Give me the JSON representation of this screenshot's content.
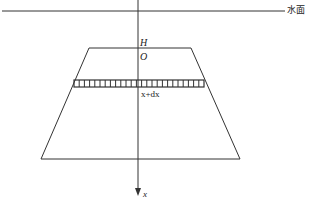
{
  "diagram": {
    "water_surface_label": "水面",
    "depth_label_H": "H",
    "origin_label": "O",
    "strip_label": "x+dx",
    "axis_label": "x",
    "strip_cells": 25,
    "colors": {
      "stroke": "#333333",
      "background": "#ffffff"
    }
  }
}
